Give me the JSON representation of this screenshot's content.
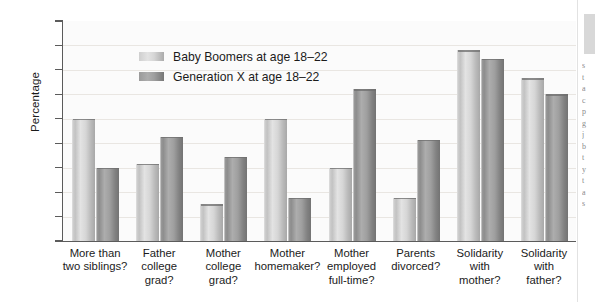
{
  "chart_data": {
    "type": "bar",
    "title": "",
    "subtitle": "",
    "xlabel": "",
    "ylabel": "Percentage",
    "ylim": [
      0,
      90
    ],
    "ytick_step": 10,
    "yticks": [
      90,
      80,
      70,
      60,
      50,
      40,
      30,
      20,
      10,
      0
    ],
    "grid": "faint horizontal gridlines",
    "legend_position": "inside upper-center-left",
    "categories": [
      "More than two siblings?",
      "Father college grad?",
      "Mother college grad?",
      "Mother homemaker?",
      "Mother employed full-time?",
      "Parents divorced?",
      "Solidarity with mother?",
      "Solidarity with father?"
    ],
    "category_lines": [
      [
        "More than",
        "two siblings?"
      ],
      [
        "Father",
        "college",
        "grad?"
      ],
      [
        "Mother",
        "college",
        "grad?"
      ],
      [
        "Mother",
        "homemaker?"
      ],
      [
        "Mother",
        "employed",
        "full-time?"
      ],
      [
        "Parents",
        "divorced?"
      ],
      [
        "Solidarity",
        "with",
        "mother?"
      ],
      [
        "Solidarity",
        "with",
        "father?"
      ]
    ],
    "series": [
      {
        "name": "Baby Boomers at age 18–22",
        "color": "#d4d4d4",
        "values": [
          50,
          31.5,
          15,
          50,
          30,
          17.5,
          78,
          66.5
        ]
      },
      {
        "name": "Generation X at age 18–22",
        "color": "#8f8f8f",
        "values": [
          30,
          42.5,
          34.5,
          17.5,
          62,
          41.5,
          74.5,
          60
        ]
      }
    ]
  },
  "axis": {
    "y_title": "Percentage",
    "tick_labels": [
      "90",
      "80",
      "70",
      "60",
      "50",
      "40",
      "30",
      "20",
      "10",
      "0"
    ]
  },
  "legend": {
    "entries": [
      {
        "label": "Baby Boomers at age 18–22",
        "swatch": "light"
      },
      {
        "label": "Generation X at age 18–22",
        "swatch": "dark"
      }
    ]
  },
  "gutter": {
    "text": "s\nt\na\nc\np\ng\nj\nb\nt\ny\nt\na\ns"
  }
}
